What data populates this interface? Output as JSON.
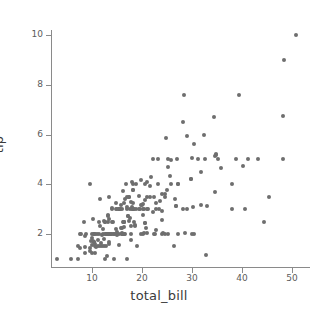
{
  "chart_data": {
    "type": "scatter",
    "title": "",
    "xlabel": "total_bill",
    "ylabel": "tip",
    "xlim": [
      0.4,
      52.2
    ],
    "ylim": [
      0.5,
      10.7
    ],
    "xticks": [
      10,
      20,
      30,
      40,
      50
    ],
    "yticks": [
      2,
      4,
      6,
      8,
      10
    ],
    "xticklabels": [
      "10",
      "20",
      "30",
      "40",
      "50"
    ],
    "yticklabels": [
      "2",
      "4",
      "6",
      "8",
      "10"
    ],
    "grid": false,
    "legend": "none",
    "marker": {
      "shape": "circle",
      "color": "#6e6e6e",
      "size_px": 4,
      "edgecolor": "none",
      "alpha": 1
    },
    "axis_color": "#8a8a8a",
    "tick_label_color": "#5c5c5c",
    "axis_title_color": "#3b3b3b",
    "background": "#ffffff",
    "n_points": 244,
    "series": [
      {
        "name": "tips",
        "x": [
          16.99,
          10.34,
          21.01,
          23.68,
          24.59,
          25.29,
          8.77,
          26.88,
          15.04,
          14.78,
          10.27,
          35.26,
          15.42,
          18.43,
          14.83,
          21.58,
          10.33,
          16.29,
          16.97,
          20.65,
          17.92,
          20.29,
          15.77,
          39.42,
          19.82,
          17.81,
          13.37,
          12.69,
          21.7,
          19.65,
          9.55,
          18.35,
          15.06,
          20.69,
          17.78,
          24.06,
          16.31,
          16.93,
          18.69,
          31.27,
          16.04,
          17.46,
          13.94,
          9.68,
          30.4,
          18.29,
          22.23,
          32.4,
          28.55,
          18.04,
          12.54,
          10.29,
          34.81,
          9.94,
          25.56,
          19.49,
          38.01,
          26.41,
          11.24,
          48.27,
          20.29,
          13.81,
          11.02,
          18.29,
          17.59,
          20.08,
          16.45,
          3.07,
          20.23,
          15.01,
          12.02,
          17.07,
          26.86,
          25.28,
          14.73,
          10.51,
          17.92,
          27.2,
          22.76,
          17.29,
          19.44,
          16.66,
          10.07,
          32.68,
          15.98,
          34.83,
          13.03,
          18.28,
          24.71,
          21.16,
          28.97,
          22.49,
          5.75,
          16.32,
          22.75,
          40.17,
          27.28,
          12.03,
          21.01,
          12.46,
          11.35,
          15.38,
          44.3,
          22.42,
          20.92,
          15.36,
          20.49,
          25.21,
          18.24,
          14.31,
          14.0,
          7.25,
          38.07,
          23.95,
          25.71,
          17.31,
          29.93,
          10.65,
          12.43,
          24.08,
          11.69,
          13.42,
          14.26,
          15.95,
          12.48,
          29.8,
          8.52,
          14.52,
          11.38,
          22.82,
          19.08,
          20.27,
          11.17,
          12.26,
          18.26,
          8.51,
          10.33,
          14.15,
          16.0,
          13.16,
          17.47,
          34.3,
          41.19,
          27.05,
          16.43,
          8.35,
          18.64,
          11.87,
          9.78,
          7.51,
          14.07,
          13.13,
          17.26,
          24.55,
          19.77,
          29.85,
          48.17,
          25.0,
          13.39,
          16.49,
          21.5,
          12.66,
          16.21,
          13.81,
          17.51,
          24.52,
          20.76,
          31.71,
          10.59,
          10.63,
          50.81,
          15.81,
          7.25,
          31.85,
          16.82,
          32.9,
          17.89,
          14.48,
          9.6,
          34.63,
          34.65,
          23.33,
          45.35,
          23.17,
          40.55,
          20.69,
          20.9,
          30.46,
          18.15,
          23.1,
          15.69,
          19.81,
          28.44,
          15.48,
          16.58,
          7.56,
          10.34,
          43.11,
          13.0,
          13.51,
          18.71,
          12.74,
          13.0,
          16.4,
          20.53,
          16.47,
          26.59,
          38.73,
          24.27,
          12.76,
          30.06,
          25.89,
          48.33,
          13.27,
          28.17,
          12.9,
          28.15,
          11.59,
          7.74,
          30.14,
          12.16,
          13.42,
          8.58,
          15.98,
          13.42,
          16.27,
          10.09,
          20.45,
          13.28,
          22.12,
          24.01,
          15.69,
          11.61,
          10.77,
          15.53,
          10.07,
          12.6,
          32.83,
          35.83,
          29.03,
          27.18,
          22.67,
          17.82,
          18.78
        ],
        "y": [
          1.01,
          1.66,
          3.5,
          3.31,
          3.61,
          4.71,
          2.0,
          3.12,
          1.96,
          3.23,
          1.71,
          5.0,
          1.57,
          3.0,
          3.02,
          3.92,
          1.67,
          3.71,
          3.5,
          3.35,
          4.08,
          2.75,
          2.23,
          7.58,
          3.18,
          2.34,
          2.0,
          2.0,
          4.3,
          3.0,
          1.45,
          2.5,
          3.0,
          2.45,
          3.27,
          3.6,
          2.0,
          3.07,
          2.31,
          5.0,
          2.24,
          2.54,
          3.06,
          1.32,
          5.6,
          3.0,
          5.0,
          6.0,
          2.05,
          3.0,
          2.5,
          2.6,
          5.2,
          1.56,
          4.34,
          3.51,
          3.0,
          1.5,
          1.76,
          6.73,
          3.21,
          2.0,
          1.98,
          3.76,
          2.64,
          3.15,
          2.47,
          1.0,
          2.01,
          2.09,
          1.97,
          3.0,
          3.14,
          5.0,
          2.2,
          1.25,
          3.08,
          4.0,
          3.0,
          2.71,
          3.0,
          3.4,
          1.83,
          5.0,
          2.03,
          5.17,
          2.0,
          4.0,
          5.85,
          3.0,
          3.0,
          2.01,
          1.0,
          2.5,
          3.25,
          4.73,
          4.0,
          1.5,
          3.0,
          1.5,
          2.5,
          3.0,
          2.5,
          3.48,
          4.08,
          3.0,
          2.03,
          2.0,
          3.76,
          1.0,
          3.0,
          1.0,
          4.0,
          2.55,
          4.0,
          3.5,
          5.07,
          1.5,
          1.8,
          2.92,
          2.31,
          1.68,
          2.5,
          2.0,
          2.52,
          4.2,
          1.48,
          2.0,
          2.0,
          2.18,
          1.5,
          3.0,
          1.5,
          2.0,
          3.25,
          1.25,
          2.0,
          2.0,
          2.0,
          2.75,
          3.5,
          6.7,
          5.0,
          5.0,
          2.3,
          2.5,
          2.36,
          1.63,
          1.73,
          2.0,
          2.5,
          2.0,
          2.74,
          2.0,
          2.0,
          4.2,
          5.0,
          3.75,
          2.61,
          2.0,
          3.5,
          2.5,
          2.0,
          2.0,
          3.0,
          3.48,
          2.24,
          4.5,
          1.61,
          2.0,
          10.0,
          3.16,
          1.5,
          3.18,
          4.0,
          3.11,
          2.0,
          2.0,
          4.0,
          5.15,
          3.68,
          3.0,
          3.5,
          5.0,
          3.0,
          2.45,
          2.03,
          2.0,
          3.0,
          4.0,
          3.0,
          4.19,
          7.58,
          2.02,
          2.0,
          1.44,
          2.0,
          5.0,
          2.0,
          2.0,
          4.0,
          2.0,
          2.0,
          2.5,
          4.0,
          3.23,
          3.41,
          5.0,
          2.03,
          1.5,
          2.0,
          4.99,
          9.0,
          2.5,
          6.5,
          1.1,
          3.0,
          1.5,
          2.0,
          3.09,
          2.2,
          3.48,
          1.92,
          3.0,
          1.58,
          2.5,
          2.0,
          3.0,
          2.72,
          2.88,
          2.0,
          3.0,
          3.39,
          1.47,
          3.0,
          1.25,
          1.0,
          1.17,
          4.67,
          5.92,
          2.0,
          2.0,
          1.75,
          3.0
        ]
      }
    ]
  }
}
